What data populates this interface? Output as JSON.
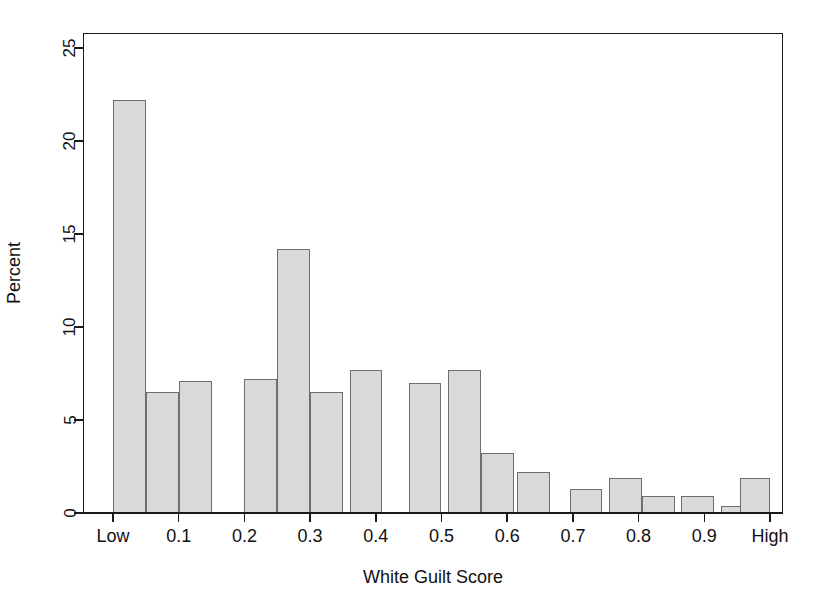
{
  "chart_data": {
    "type": "bar",
    "title": "",
    "subtitle": "",
    "xlabel": "White Guilt Score",
    "ylabel": "Percent",
    "grid": false,
    "legend": null,
    "xlim": [
      0,
      1
    ],
    "ylim": [
      0,
      25.8
    ],
    "x_tick_values": [
      0.0,
      0.1,
      0.2,
      0.3,
      0.4,
      0.5,
      0.6,
      0.7,
      0.8,
      0.9,
      1.0
    ],
    "x_tick_labels": [
      "Low",
      "0.1",
      "0.2",
      "0.3",
      "0.4",
      "0.5",
      "0.6",
      "0.7",
      "0.8",
      "0.9",
      "High"
    ],
    "y_tick_values": [
      0,
      5,
      10,
      15,
      20,
      25
    ],
    "y_tick_labels": [
      "0",
      "5",
      "10",
      "15",
      "20",
      "25"
    ],
    "bin_width": 0.05,
    "bar_fill_color": "#d9d9d9",
    "bar_border_color": "#6e6e6e",
    "axis_color": "#1a1a1a",
    "bars": [
      {
        "bin_start": 0.0,
        "bin_end": 0.05,
        "value": 22.2
      },
      {
        "bin_start": 0.05,
        "bin_end": 0.1,
        "value": 6.5
      },
      {
        "bin_start": 0.1,
        "bin_end": 0.15,
        "value": 7.1
      },
      {
        "bin_start": 0.2,
        "bin_end": 0.25,
        "value": 7.2
      },
      {
        "bin_start": 0.25,
        "bin_end": 0.3,
        "value": 14.2
      },
      {
        "bin_start": 0.3,
        "bin_end": 0.35,
        "value": 6.5
      },
      {
        "bin_start": 0.36,
        "bin_end": 0.41,
        "value": 7.7
      },
      {
        "bin_start": 0.45,
        "bin_end": 0.5,
        "value": 7.0
      },
      {
        "bin_start": 0.51,
        "bin_end": 0.56,
        "value": 7.7
      },
      {
        "bin_start": 0.56,
        "bin_end": 0.61,
        "value": 3.2
      },
      {
        "bin_start": 0.615,
        "bin_end": 0.665,
        "value": 2.2
      },
      {
        "bin_start": 0.695,
        "bin_end": 0.745,
        "value": 1.3
      },
      {
        "bin_start": 0.755,
        "bin_end": 0.805,
        "value": 1.9
      },
      {
        "bin_start": 0.805,
        "bin_end": 0.855,
        "value": 0.9
      },
      {
        "bin_start": 0.865,
        "bin_end": 0.915,
        "value": 0.9
      },
      {
        "bin_start": 0.925,
        "bin_end": 0.965,
        "value": 0.4
      },
      {
        "bin_start": 0.955,
        "bin_end": 1.0,
        "value": 1.9
      }
    ]
  }
}
